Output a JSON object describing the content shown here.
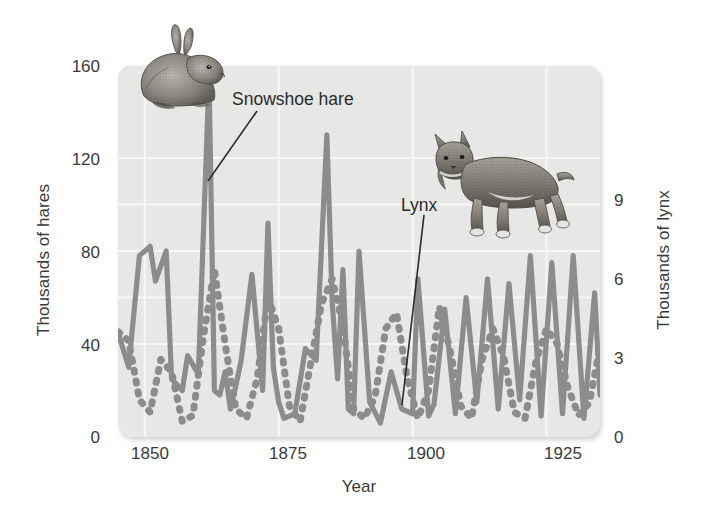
{
  "chart_data": {
    "type": "line",
    "title": "",
    "xlabel": "Year",
    "ylabel": "Thousands of hares",
    "ylabel_right": "Thousands of lynx",
    "xlim": [
      1845,
      1935
    ],
    "ylim": [
      0,
      160
    ],
    "ylim_right": [
      0,
      12
    ],
    "xticks": [
      1850,
      1875,
      1900,
      1925
    ],
    "xtick_labels": [
      "1850",
      "1875",
      "1900",
      "1925"
    ],
    "yticks": [
      0,
      40,
      80,
      120,
      160
    ],
    "ytick_labels": [
      "0",
      "40",
      "80",
      "120",
      "160"
    ],
    "yticks_right": [
      0,
      3,
      6,
      9
    ],
    "ytick_labels_right": [
      "0",
      "3",
      "6",
      "9"
    ],
    "grid": true,
    "gridlines_horizontal": [
      40,
      60,
      80,
      100,
      120,
      160
    ],
    "legend_position": "inline-annotations",
    "annotations": [
      {
        "label": "Snowshoe hare",
        "series": "hare"
      },
      {
        "label": "Lynx",
        "series": "lynx"
      }
    ],
    "series": [
      {
        "name": "Snowshoe hare",
        "axis": "left",
        "units": "thousands",
        "style": "solid",
        "color": "#8c8c8c",
        "x": [
          1845,
          1847,
          1849,
          1851,
          1852,
          1854,
          1855,
          1857,
          1858,
          1860,
          1862,
          1863,
          1864,
          1865,
          1866,
          1867,
          1868,
          1870,
          1872,
          1873,
          1874,
          1875,
          1876,
          1878,
          1880,
          1882,
          1884,
          1885,
          1886,
          1887,
          1888,
          1889,
          1890,
          1892,
          1894,
          1896,
          1898,
          1900,
          1901,
          1903,
          1904,
          1906,
          1908,
          1910,
          1912,
          1914,
          1916,
          1918,
          1920,
          1922,
          1924,
          1926,
          1928,
          1930,
          1932,
          1934,
          1935
        ],
        "y": [
          45,
          30,
          78,
          82,
          67,
          80,
          25,
          20,
          35,
          27,
          155,
          20,
          18,
          28,
          12,
          22,
          33,
          70,
          20,
          92,
          30,
          15,
          8,
          10,
          38,
          33,
          130,
          58,
          25,
          72,
          12,
          10,
          80,
          15,
          6,
          28,
          12,
          10,
          68,
          9,
          14,
          55,
          10,
          60,
          15,
          68,
          12,
          66,
          16,
          78,
          9,
          75,
          10,
          78,
          8,
          62,
          18
        ]
      },
      {
        "name": "Lynx",
        "axis": "right",
        "units": "thousands",
        "style": "dotted",
        "color": "#8c8c8c",
        "x": [
          1845,
          1847,
          1849,
          1851,
          1853,
          1855,
          1857,
          1859,
          1861,
          1863,
          1865,
          1867,
          1869,
          1871,
          1873,
          1875,
          1877,
          1879,
          1881,
          1883,
          1885,
          1887,
          1889,
          1891,
          1893,
          1895,
          1897,
          1899,
          1901,
          1903,
          1905,
          1907,
          1909,
          1911,
          1913,
          1915,
          1917,
          1919,
          1921,
          1923,
          1925,
          1927,
          1929,
          1931,
          1933,
          1935
        ],
        "y": [
          3.4,
          3.1,
          1.2,
          0.8,
          2.5,
          2.1,
          0.5,
          0.7,
          3.3,
          5.4,
          3.0,
          0.9,
          0.6,
          1.9,
          4.5,
          3.5,
          1.0,
          0.5,
          2.4,
          4.3,
          5.1,
          3.6,
          0.9,
          0.6,
          1.3,
          3.5,
          4.0,
          1.9,
          0.6,
          1.5,
          4.2,
          2.8,
          1.0,
          0.6,
          2.5,
          3.5,
          2.6,
          0.8,
          0.6,
          2.4,
          3.5,
          3.0,
          1.6,
          0.7,
          1.1,
          2.9
        ]
      }
    ]
  },
  "figure": {
    "axis_title_left": "Thousands of hares",
    "axis_title_right": "Thousands of lynx",
    "axis_title_x": "Year",
    "annotation_hare": "Snowshoe hare",
    "annotation_lynx": "Lynx",
    "tick_left_160": "160",
    "tick_left_120": "120",
    "tick_left_80": "80",
    "tick_left_40": "40",
    "tick_left_0": "0",
    "tick_right_9": "9",
    "tick_right_6": "6",
    "tick_right_3": "3",
    "tick_right_0": "0",
    "tick_x_1850": "1850",
    "tick_x_1875": "1875",
    "tick_x_1900": "1900",
    "tick_x_1925": "1925",
    "icon_hare": "hare-illustration",
    "icon_lynx": "lynx-illustration"
  },
  "colors": {
    "panel_background": "#e7e7e5",
    "gridline": "#f5f5f4",
    "series_line": "#8c8c8c",
    "text": "#3a3a3a",
    "page_background": "#ffffff"
  }
}
